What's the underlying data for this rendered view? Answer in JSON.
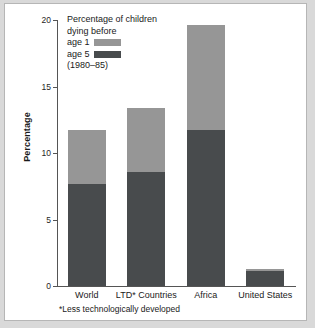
{
  "chart_data": {
    "type": "bar",
    "subtype": "stacked-vertical",
    "title": "",
    "xlabel": "",
    "ylabel": "Percentage",
    "ylim": [
      0,
      20
    ],
    "yticks": [
      0,
      5,
      10,
      15,
      20
    ],
    "ytick_labels": [
      "0",
      "5",
      "10",
      "15",
      "20"
    ],
    "grid": false,
    "legend_position": "top-left-inside",
    "categories": [
      "World",
      "LTD* Countries",
      "Africa",
      "United States"
    ],
    "series": [
      {
        "name": "age 5",
        "color": "#484b4d",
        "values": [
          7.7,
          8.6,
          11.7,
          1.1
        ]
      },
      {
        "name": "age 1",
        "color": "#969696",
        "values": [
          4.0,
          4.8,
          7.9,
          0.2
        ]
      }
    ],
    "totals": [
      11.7,
      13.4,
      19.6,
      1.3
    ],
    "legend_title_lines": [
      "Percentage of children",
      "dying before"
    ],
    "legend_items": [
      {
        "label": "age 1",
        "color": "#969696"
      },
      {
        "label": "age 5",
        "color": "#484b4d"
      }
    ],
    "legend_period": "(1980–85)",
    "footnote": "*Less technologically developed"
  },
  "axis": {
    "y_title": "Percentage"
  },
  "colors": {
    "age1": "#969696",
    "age5": "#484b4d",
    "axis": "#555555",
    "frame": "#b6b6b6",
    "page_background": "#d9d9d9",
    "plot_background": "#ffffff"
  }
}
